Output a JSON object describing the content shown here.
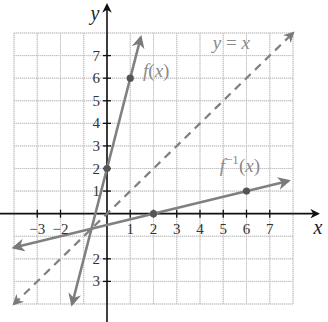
{
  "chart_data": {
    "type": "line",
    "title": "",
    "xlabel": "x",
    "ylabel": "y",
    "xlim": [
      -4,
      8
    ],
    "ylim": [
      -4,
      8
    ],
    "grid": true,
    "x_ticks": [
      -3,
      -2,
      1,
      2,
      3,
      4,
      5,
      6,
      7
    ],
    "x_tick_labels": [
      "−3",
      "−2",
      "1",
      "2",
      "3",
      "4",
      "5",
      "6",
      "7"
    ],
    "y_ticks": [
      7,
      6,
      5,
      4,
      3,
      2,
      1,
      -2,
      -3
    ],
    "y_tick_labels": [
      "7",
      "6",
      "5",
      "4",
      "3",
      "2",
      "1",
      "2",
      "3"
    ],
    "series": [
      {
        "name": "f(x)",
        "label_main": "f",
        "label_arg": "(x)",
        "equation": "y = 4x + 2",
        "style": "solid",
        "color": "#808080",
        "points": [
          [
            0,
            2
          ],
          [
            1,
            6
          ]
        ],
        "line_from": [
          -1.5,
          -4
        ],
        "line_to": [
          1.45,
          7.8
        ]
      },
      {
        "name": "f^-1(x)",
        "label_main": "f",
        "label_sup": "−1",
        "label_arg": "(x)",
        "equation": "y = (x - 2)/4",
        "style": "solid",
        "color": "#808080",
        "points": [
          [
            2,
            0
          ],
          [
            6,
            1
          ]
        ],
        "line_from": [
          -4,
          -1.5
        ],
        "line_to": [
          7.8,
          1.45
        ]
      },
      {
        "name": "y = x",
        "label_text": "y = x",
        "equation": "y = x",
        "style": "dashed",
        "color": "#808080",
        "points": [],
        "line_from": [
          -4,
          -4
        ],
        "line_to": [
          8,
          8
        ]
      }
    ]
  }
}
